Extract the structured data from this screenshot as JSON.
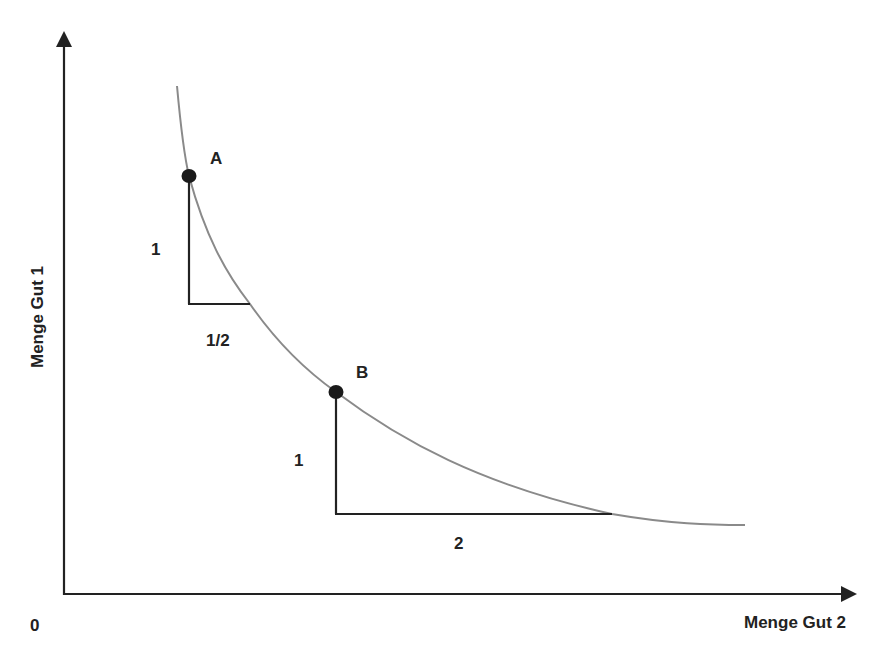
{
  "diagram": {
    "title": "",
    "axes": {
      "x_label": "Menge Gut 2",
      "y_label": "Menge Gut 1",
      "origin_label": "0"
    },
    "curve": {
      "type": "indifference-curve",
      "color": "#8a8a8a"
    },
    "points": [
      {
        "id": "A",
        "label": "A"
      },
      {
        "id": "B",
        "label": "B"
      }
    ],
    "triangles": [
      {
        "at": "A",
        "vertical_label": "1",
        "horizontal_label": "1/2"
      },
      {
        "at": "B",
        "vertical_label": "1",
        "horizontal_label": "2"
      }
    ],
    "colors": {
      "axis": "#222222",
      "curve": "#8a8a8a",
      "point": "#1a1a1a",
      "text": "#222222"
    }
  }
}
